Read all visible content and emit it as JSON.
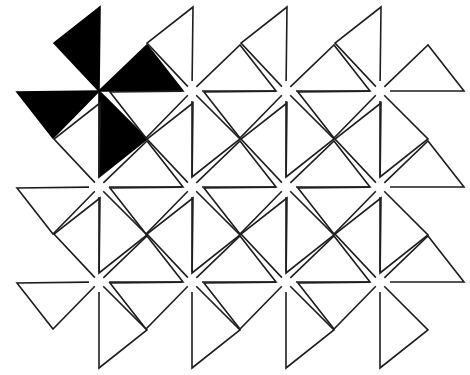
{
  "figure": {
    "width": 470,
    "height": 375,
    "colors": {
      "line": "#1e1e1e",
      "highlight": "#000000",
      "background": "#ffffff"
    },
    "pinwheel": {
      "blades": [
        {
          "name": "top",
          "points": [
            [
              0,
              0
            ],
            [
              1,
              -84
            ],
            [
              -45,
              -48
            ]
          ]
        },
        {
          "name": "right",
          "points": [
            [
              0,
              0
            ],
            [
              84,
              0
            ],
            [
              48,
              -46
            ]
          ]
        },
        {
          "name": "bottom",
          "points": [
            [
              0,
              0
            ],
            [
              0,
              86
            ],
            [
              48,
              48
            ]
          ]
        },
        {
          "name": "left",
          "points": [
            [
              0,
              0
            ],
            [
              -82,
              1
            ],
            [
              -46,
              47
            ]
          ]
        }
      ],
      "center_gap": 10
    },
    "grid": {
      "columns_x": [
        99,
        192,
        286,
        380
      ],
      "rows_y": [
        91,
        187,
        282
      ]
    },
    "highlighted": [
      {
        "row": 0,
        "col": 0
      }
    ]
  }
}
